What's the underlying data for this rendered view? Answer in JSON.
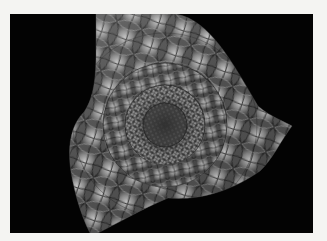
{
  "image": {
    "subject": "grayscale fractal trefoil with hyperbolic petal tiling",
    "border_color": "#f4f4f2",
    "panel_color": "#030303",
    "tile_highlight": "#d8d8d8",
    "tile_midtone": "#7a7a7a",
    "tile_shadow": "#1a1a1a",
    "center": {
      "x": 165,
      "y": 125
    },
    "lobes": [
      {
        "name": "top",
        "tip": {
          "x": 135,
          "y": 14
        }
      },
      {
        "name": "right",
        "tip": {
          "x": 292,
          "y": 126
        }
      },
      {
        "name": "bottom-left",
        "tip": {
          "x": 95,
          "y": 232
        }
      }
    ]
  }
}
